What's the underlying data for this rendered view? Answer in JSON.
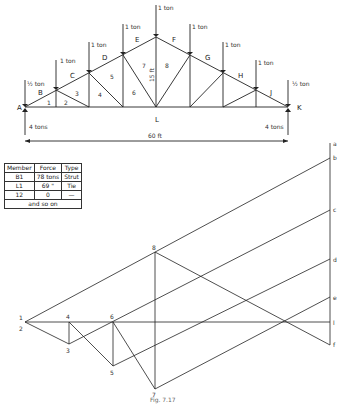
{
  "truss": {
    "loads": [
      "½ ton",
      "1 ton",
      "1 ton",
      "1 ton",
      "1 ton",
      "1 ton",
      "1 ton",
      "1 ton",
      "½ ton"
    ],
    "reactions": {
      "left": "4 tons",
      "right": "4 tons"
    },
    "span": "60 ft",
    "height": "15 ft",
    "joint_labels": {
      "A": "A",
      "B": "B",
      "C": "C",
      "D": "D",
      "E": "E",
      "F": "F",
      "G": "G",
      "H": "H",
      "J": "J",
      "K": "K",
      "L": "L"
    },
    "member_numbers": [
      "1",
      "2",
      "3",
      "4",
      "5",
      "6",
      "7",
      "8"
    ]
  },
  "table": {
    "headers": [
      "Member",
      "Force",
      "Type"
    ],
    "rows": [
      [
        "B1",
        "78 tons",
        "Strut"
      ],
      [
        "L1",
        "69 \"",
        "Tie"
      ],
      [
        "12",
        "0",
        "—"
      ]
    ],
    "footer": "and so on"
  },
  "force_diagram": {
    "load_line_labels": [
      "a",
      "b",
      "c",
      "d",
      "e",
      "l",
      "f"
    ],
    "point_labels": [
      "1",
      "2",
      "3",
      "4",
      "5",
      "6",
      "7",
      "8"
    ]
  },
  "caption": "Fig. 7.17"
}
